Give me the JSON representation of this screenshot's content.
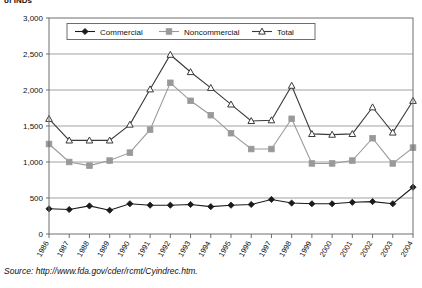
{
  "title": "of INDs",
  "source": "Source: http://www.fda.gov/cder/rcmt/Cyindrec.htm.",
  "legend": {
    "commercial": "Commercial",
    "noncommercial": "Noncommercial",
    "total": "Total"
  },
  "colors": {
    "commercial": "#1a1a1a",
    "noncommercial": "#999999",
    "total": "#3a3a3a",
    "grid": "#8c8c8c",
    "axis": "#6e6e6e"
  },
  "chart_data": {
    "type": "line",
    "title": "of INDs",
    "xlabel": "",
    "ylabel": "",
    "ylim": [
      0,
      3000
    ],
    "yticks": [
      "0",
      "500",
      "1,000",
      "1,500",
      "2,000",
      "2,500",
      "3,000"
    ],
    "ytick_values": [
      0,
      500,
      1000,
      1500,
      2000,
      2500,
      3000
    ],
    "grid": true,
    "legend_position": "top-inside",
    "categories": [
      "1986",
      "1987",
      "1988",
      "1989",
      "1990",
      "1991",
      "1992",
      "1993",
      "1994",
      "1995",
      "1996",
      "1997",
      "1998",
      "1999",
      "2000",
      "2001",
      "2002",
      "2003",
      "2004"
    ],
    "series": [
      {
        "name": "Commercial",
        "marker": "diamond",
        "values": [
          350,
          340,
          390,
          330,
          420,
          400,
          400,
          410,
          380,
          400,
          410,
          480,
          430,
          420,
          420,
          440,
          450,
          420,
          650
        ]
      },
      {
        "name": "Noncommercial",
        "marker": "square",
        "values": [
          1250,
          1000,
          950,
          1020,
          1130,
          1450,
          2100,
          1850,
          1650,
          1400,
          1180,
          1180,
          1600,
          980,
          980,
          1020,
          1330,
          980,
          1200
        ]
      },
      {
        "name": "Total",
        "marker": "triangle",
        "values": [
          1600,
          1300,
          1300,
          1300,
          1520,
          2010,
          2490,
          2250,
          2030,
          1800,
          1570,
          1580,
          2060,
          1390,
          1380,
          1390,
          1760,
          1410,
          1850
        ]
      }
    ]
  }
}
